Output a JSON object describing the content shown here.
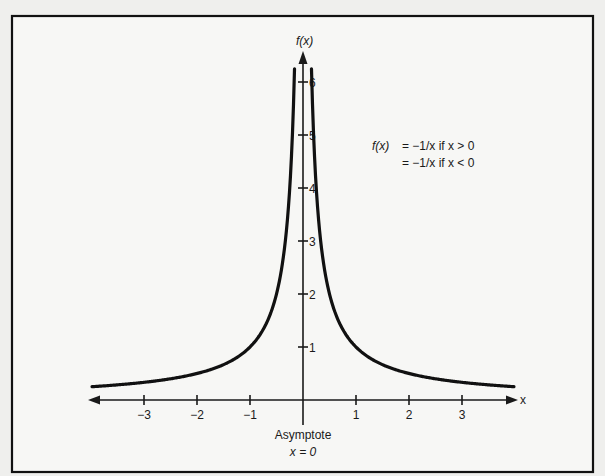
{
  "chart_data": {
    "type": "line",
    "title": "",
    "xlabel": "x",
    "ylabel": "f(x)",
    "x_ticks": [
      -3,
      -2,
      -1,
      1,
      2,
      3
    ],
    "x_tick_labels": [
      "−3",
      "−2",
      "−1",
      "1",
      "2",
      "3"
    ],
    "y_ticks": [
      1,
      2,
      3,
      4,
      5,
      6
    ],
    "y_tick_labels": [
      "1",
      "2",
      "3",
      "4",
      "5",
      "6"
    ],
    "xlim": [
      -4,
      4
    ],
    "ylim": [
      0,
      6.5
    ],
    "grid": false,
    "legend": "none",
    "annotations": [
      {
        "text": "f(x)  =  −1/x if x > 0",
        "position": "upper-right"
      },
      {
        "text": "=  −1/x if x < 0",
        "position": "upper-right"
      },
      {
        "text": "Asymptote",
        "position": "below-origin"
      },
      {
        "text": "x = 0",
        "position": "below-origin"
      }
    ],
    "series": [
      {
        "name": "left branch (x < 0)",
        "x": [
          -3.98,
          -3,
          -2,
          -1.5,
          -1,
          -0.75,
          -0.5,
          -0.35,
          -0.25,
          -0.2,
          -0.16
        ],
        "y": [
          0.25,
          0.33,
          0.5,
          0.67,
          1.0,
          1.33,
          2.0,
          2.86,
          4.0,
          5.0,
          6.3
        ]
      },
      {
        "name": "right branch (x > 0)",
        "x": [
          0.16,
          0.2,
          0.25,
          0.35,
          0.5,
          0.75,
          1,
          1.5,
          2,
          3,
          3.98
        ],
        "y": [
          6.3,
          5.0,
          4.0,
          2.86,
          2.0,
          1.33,
          1.0,
          0.67,
          0.5,
          0.33,
          0.25
        ]
      }
    ],
    "asymptote": {
      "x": 0
    }
  },
  "labels": {
    "y_axis": "f(x)",
    "x_axis": "x",
    "eq_line1_lhs": "f(x)",
    "eq_line1_rhs": "=  −1/x if x > 0",
    "eq_line2": "=  −1/x if x < 0",
    "asymptote_title": "Asymptote",
    "asymptote_eq": "x = 0"
  },
  "colors": {
    "ink": "#111111",
    "paper": "#f7f7f5",
    "background": "#efefed"
  }
}
